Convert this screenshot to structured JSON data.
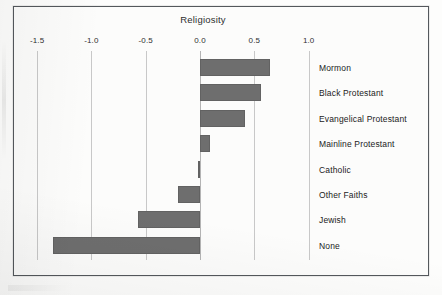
{
  "figure": {
    "title": "Religiosity"
  },
  "chart_data": {
    "type": "bar",
    "orientation": "horizontal",
    "title": "Religiosity",
    "xlabel": "",
    "ylabel": "",
    "xlim": [
      -1.5,
      1.0
    ],
    "grid": true,
    "legend": "none",
    "axis_position": "top",
    "bar_color": "#6e6e6e",
    "gridline_color": "#c8c8c8",
    "frame_color": "#54585c",
    "background_color": "#fcfcfb",
    "ticks": [
      "-1.5",
      "-1.0",
      "-0.5",
      "0.0",
      "0.5",
      "1.0"
    ],
    "tick_values": [
      -1.5,
      -1.0,
      -0.5,
      0.0,
      0.5,
      1.0
    ],
    "categories": [
      "Mormon",
      "Black Protestant",
      "Evangelical Protestant",
      "Mainline Protestant",
      "Catholic",
      "Other Faiths",
      "Jewish",
      "None"
    ],
    "values": [
      0.64,
      0.56,
      0.41,
      0.09,
      -0.02,
      -0.2,
      -0.57,
      -1.35
    ]
  }
}
